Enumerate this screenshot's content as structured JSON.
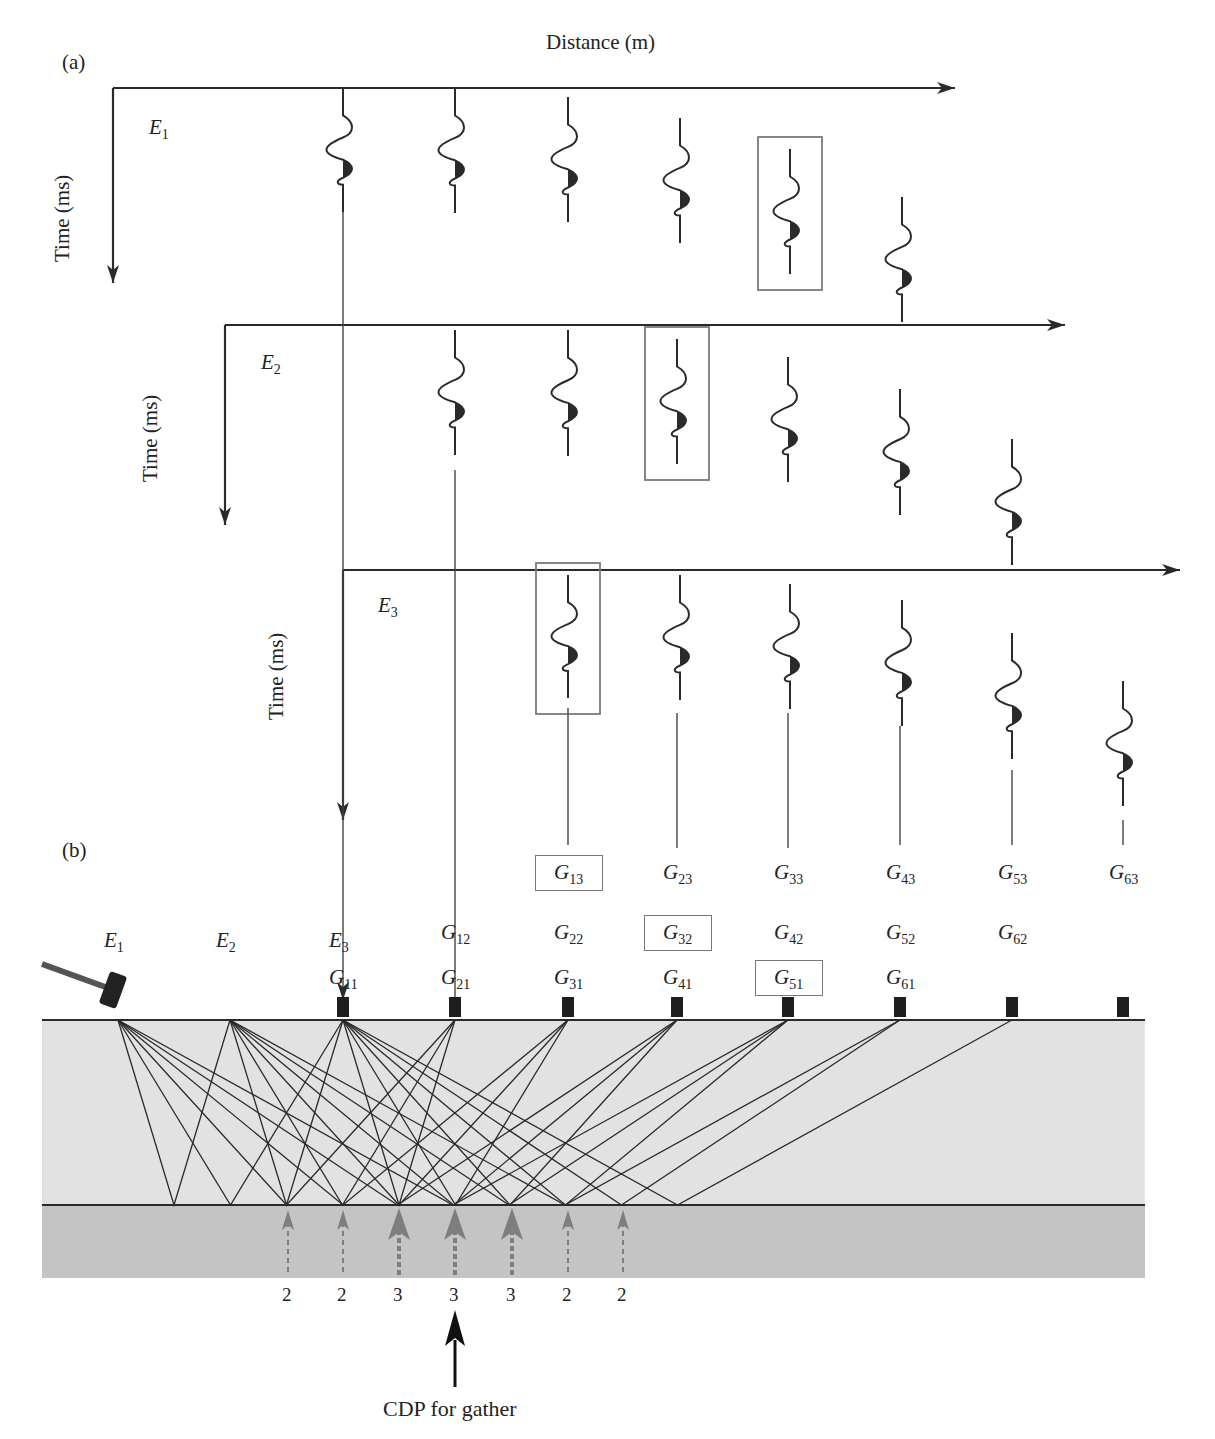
{
  "panel_a": {
    "label": "(a)",
    "x_axis_label": "Distance (m)",
    "y_axis_label": "Time (ms)",
    "gathers": [
      {
        "shot": "E",
        "shot_sub": "1",
        "origin": [
          113,
          88
        ],
        "axis_end_x": 955,
        "axis_len_y": 195,
        "traces": [
          {
            "x": 343,
            "top": 88,
            "bottom": 212
          },
          {
            "x": 455,
            "top": 88,
            "bottom": 213
          },
          {
            "x": 568,
            "top": 97,
            "bottom": 222
          },
          {
            "x": 680,
            "top": 118,
            "bottom": 243
          },
          {
            "x": 790,
            "top": 149,
            "bottom": 274,
            "boxed": true
          },
          {
            "x": 902,
            "top": 197,
            "bottom": 322
          }
        ]
      },
      {
        "shot": "E",
        "shot_sub": "2",
        "origin": [
          225,
          325
        ],
        "axis_end_x": 1065,
        "axis_len_y": 200,
        "traces": [
          {
            "x": 455,
            "top": 330,
            "bottom": 455
          },
          {
            "x": 568,
            "top": 330,
            "bottom": 456
          },
          {
            "x": 677,
            "top": 339,
            "bottom": 464,
            "boxed": true
          },
          {
            "x": 788,
            "top": 357,
            "bottom": 482
          },
          {
            "x": 900,
            "top": 389,
            "bottom": 515
          },
          {
            "x": 1012,
            "top": 439,
            "bottom": 565
          }
        ]
      },
      {
        "shot": "E",
        "shot_sub": "3",
        "origin": [
          343,
          570
        ],
        "axis_end_x": 1180,
        "axis_len_y": 250,
        "traces": [
          {
            "x": 568,
            "top": 575,
            "bottom": 698,
            "boxed": true
          },
          {
            "x": 680,
            "top": 575,
            "bottom": 700
          },
          {
            "x": 790,
            "top": 584,
            "bottom": 709
          },
          {
            "x": 902,
            "top": 600,
            "bottom": 726
          },
          {
            "x": 1012,
            "top": 633,
            "bottom": 759
          },
          {
            "x": 1123,
            "top": 681,
            "bottom": 806
          }
        ]
      }
    ]
  },
  "panel_b": {
    "label": "(b)",
    "shots": [
      {
        "name": "E",
        "sub": "1",
        "x": 118
      },
      {
        "name": "E",
        "sub": "2",
        "x": 230
      },
      {
        "name": "E",
        "sub": "3",
        "x": 343
      }
    ],
    "receivers_x": [
      343,
      455,
      568,
      677,
      788,
      900,
      1012,
      1123
    ],
    "geophone_labels": [
      {
        "text": "G",
        "sub": "11",
        "x": 343,
        "row": 3
      },
      {
        "text": "G",
        "sub": "12",
        "x": 455,
        "row": 2
      },
      {
        "text": "G",
        "sub": "21",
        "x": 455,
        "row": 3
      },
      {
        "text": "G",
        "sub": "13",
        "x": 568,
        "row": 1,
        "boxed": true
      },
      {
        "text": "G",
        "sub": "22",
        "x": 568,
        "row": 2
      },
      {
        "text": "G",
        "sub": "31",
        "x": 568,
        "row": 3
      },
      {
        "text": "G",
        "sub": "23",
        "x": 677,
        "row": 1
      },
      {
        "text": "G",
        "sub": "32",
        "x": 677,
        "row": 2,
        "boxed": true
      },
      {
        "text": "G",
        "sub": "41",
        "x": 677,
        "row": 3
      },
      {
        "text": "G",
        "sub": "33",
        "x": 788,
        "row": 1
      },
      {
        "text": "G",
        "sub": "42",
        "x": 788,
        "row": 2
      },
      {
        "text": "G",
        "sub": "51",
        "x": 788,
        "row": 3,
        "boxed": true
      },
      {
        "text": "G",
        "sub": "43",
        "x": 900,
        "row": 1
      },
      {
        "text": "G",
        "sub": "52",
        "x": 900,
        "row": 2
      },
      {
        "text": "G",
        "sub": "61",
        "x": 900,
        "row": 3
      },
      {
        "text": "G",
        "sub": "53",
        "x": 1012,
        "row": 1
      },
      {
        "text": "G",
        "sub": "62",
        "x": 1012,
        "row": 2
      },
      {
        "text": "G",
        "sub": "63",
        "x": 1123,
        "row": 1
      }
    ],
    "fold_counts": [
      {
        "x": 288,
        "count": "2"
      },
      {
        "x": 343,
        "count": "2"
      },
      {
        "x": 399,
        "count": "3"
      },
      {
        "x": 455,
        "count": "3"
      },
      {
        "x": 512,
        "count": "3"
      },
      {
        "x": 568,
        "count": "2"
      },
      {
        "x": 623,
        "count": "2"
      }
    ],
    "cdp_arrow_x": 455,
    "cdp_label": "CDP for gather",
    "colors": {
      "upper_layer": "#e2e2e2",
      "lower_layer": "#c4c4c4",
      "ink": "#2a2a2a",
      "box": "#7a7a7a",
      "fold_arrow": "#7e7e7e"
    }
  }
}
